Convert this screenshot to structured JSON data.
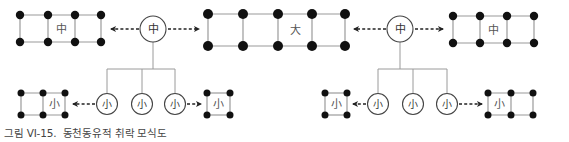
{
  "diagram": {
    "title": "동천동유적 취락 모식도",
    "colors": {
      "line": "#9a9a9a",
      "dot": "#111111",
      "text": "#555555",
      "arrow": "#222222",
      "circle": "#444444"
    },
    "labels": {
      "large": "大",
      "medium": "中",
      "small": "小"
    },
    "top_row": {
      "left_grid": {
        "label": "中",
        "cols": 3,
        "xs": [
          20,
          48,
          75,
          101
        ],
        "ys": [
          15,
          42
        ],
        "label_cell": 1
      },
      "left_hub": {
        "label": "中",
        "cx": 153,
        "cy": 29,
        "r": 13
      },
      "center_grid": {
        "label": "大",
        "cols": 4,
        "xs": [
          208,
          243,
          278,
          312,
          345
        ],
        "ys": [
          14,
          46
        ],
        "label_cell": 2
      },
      "right_hub": {
        "label": "中",
        "cx": 400,
        "cy": 29,
        "r": 13
      },
      "right_grid": {
        "label": "中",
        "cols": 3,
        "xs": [
          453,
          480,
          507,
          534
        ],
        "ys": [
          16,
          43
        ],
        "label_cell": 1
      }
    },
    "bottom_row": {
      "left_group": {
        "left_grid": {
          "label": "小",
          "cols": 2,
          "xs": [
            21,
            43,
            65
          ],
          "ys": [
            93,
            115
          ],
          "label_cell": 1
        },
        "hubs": [
          {
            "label": "小",
            "cx": 107,
            "cy": 104
          },
          {
            "label": "小",
            "cx": 142,
            "cy": 104
          },
          {
            "label": "小",
            "cx": 175,
            "cy": 104
          }
        ],
        "right_grid": {
          "label": "小",
          "cols": 1,
          "xs": [
            207,
            230
          ],
          "ys": [
            93,
            115
          ],
          "label_cell": 0
        }
      },
      "right_group": {
        "left_grid": {
          "label": "小",
          "cols": 1,
          "xs": [
            325,
            347
          ],
          "ys": [
            93,
            115
          ],
          "label_cell": 0
        },
        "hubs": [
          {
            "label": "小",
            "cx": 378,
            "cy": 104
          },
          {
            "label": "小",
            "cx": 413,
            "cy": 104
          },
          {
            "label": "小",
            "cx": 447,
            "cy": 104
          }
        ],
        "right_grid": {
          "label": "小",
          "cols": 2,
          "xs": [
            488,
            511,
            533
          ],
          "ys": [
            93,
            115
          ],
          "label_cell": 0
        }
      }
    }
  },
  "caption": {
    "figure_number": "그림 VI-15.",
    "text": "동천동유적 취락 모식도"
  }
}
